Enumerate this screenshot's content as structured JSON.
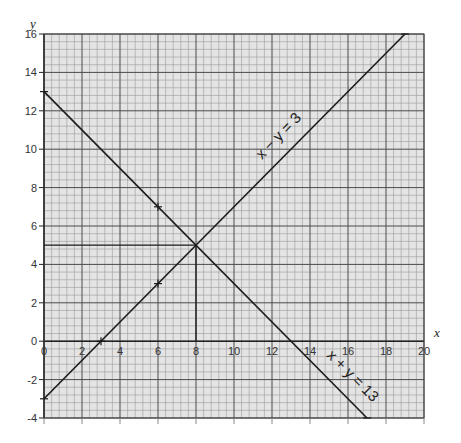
{
  "chart_data": {
    "type": "line",
    "title": "",
    "xlabel": "x",
    "ylabel": "y",
    "xlim": [
      0,
      20
    ],
    "ylim": [
      -4,
      16
    ],
    "grid": true,
    "grid_major_step": 2,
    "grid_minor_step": 0.4,
    "x_ticks": [
      0,
      2,
      4,
      6,
      8,
      10,
      12,
      14,
      16,
      18,
      20
    ],
    "x_tick_labels": [
      "0",
      "2",
      "4",
      "6",
      "8",
      "10",
      "12",
      "14",
      "16",
      "18",
      "20"
    ],
    "y_ticks": [
      -4,
      -2,
      0,
      2,
      4,
      6,
      8,
      10,
      12,
      14,
      16
    ],
    "y_tick_labels": [
      "-4",
      "-2",
      "0",
      "2",
      "4",
      "6",
      "8",
      "10",
      "12",
      "14",
      "16"
    ],
    "series": [
      {
        "name": "x − y = 3",
        "label": "x − y = 3",
        "points": [
          [
            0,
            -3
          ],
          [
            19,
            16
          ]
        ],
        "marked_points": [
          [
            6,
            3
          ],
          [
            3,
            0
          ]
        ]
      },
      {
        "name": "x + y = 13",
        "label": "x + y = 13",
        "points": [
          [
            0,
            13
          ],
          [
            17,
            -4
          ]
        ],
        "marked_points": [
          [
            6,
            7
          ]
        ]
      }
    ],
    "annotations": [
      {
        "type": "intersection",
        "point": [
          8,
          5
        ]
      },
      {
        "type": "guide-line",
        "from": [
          0,
          5
        ],
        "to": [
          8,
          5
        ]
      },
      {
        "type": "guide-line",
        "from": [
          8,
          5
        ],
        "to": [
          8,
          0
        ]
      }
    ]
  },
  "labels": {
    "x_axis": "x",
    "y_axis": "y",
    "line1": "x − y = 3",
    "line2": "x + y = 13"
  },
  "colors": {
    "background": "#ffffff",
    "plot_fill": "#e4e4e4",
    "minor_grid": "#9a9a9a",
    "major_grid": "#4a4a4a",
    "line": "#1a1a1a"
  }
}
